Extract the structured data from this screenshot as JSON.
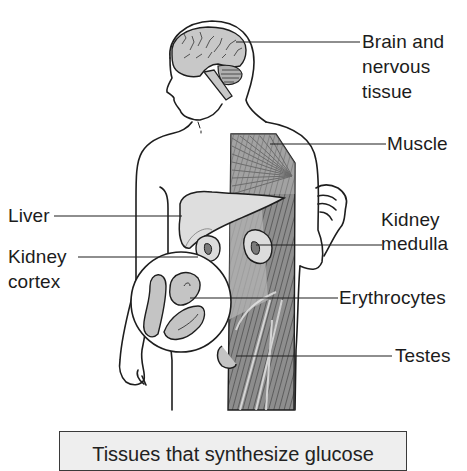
{
  "figure": {
    "type": "anatomical-diagram",
    "colors": {
      "outline": "#1e1e1e",
      "organ_fill": "#c8c8c8",
      "liver_fill": "#dedede",
      "muscle_fill": "#9a9a9a",
      "caption_bg": "#eeeeee",
      "background": "#ffffff"
    }
  },
  "labels": {
    "brain": {
      "line1": "Brain and",
      "line2": "nervous",
      "line3": "tissue"
    },
    "muscle": "Muscle",
    "liver": "Liver",
    "kidney_cortex": {
      "line1": "Kidney",
      "line2": "cortex"
    },
    "kidney_medulla": {
      "line1": "Kidney",
      "line2": "medulla"
    },
    "erythrocytes": "Erythrocytes",
    "testes": "Testes"
  },
  "caption": {
    "text": "Tissues that synthesize glucose"
  }
}
